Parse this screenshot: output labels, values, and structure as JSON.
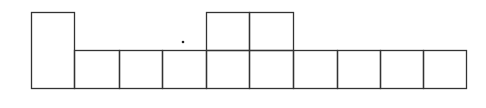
{
  "diagram": {
    "stroke_color": "#333333",
    "background": "#ffffff",
    "bottom_row": {
      "top": 50,
      "bottom": 88,
      "dividers_x": [
        31,
        74,
        119,
        162,
        206,
        249,
        293,
        337,
        380,
        423,
        466
      ]
    },
    "tall_cell": {
      "x1": 31,
      "x2": 74,
      "y1": 12,
      "y2": 88
    },
    "upper_cells": [
      {
        "x1": 206,
        "x2": 249,
        "y1": 12,
        "y2": 50
      },
      {
        "x1": 249,
        "x2": 293,
        "y1": 12,
        "y2": 50
      }
    ],
    "dot": {
      "cx": 183,
      "cy": 42,
      "r": 1.3
    }
  }
}
